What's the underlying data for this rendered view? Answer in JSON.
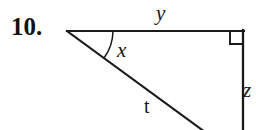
{
  "figure": {
    "problem_number": "10.",
    "labels": {
      "top_side": "y",
      "right_side": "z",
      "hypotenuse": "t",
      "angle": "x"
    },
    "geometry": {
      "apex": {
        "x": 67,
        "y": 31
      },
      "top_right": {
        "x": 243,
        "y": 31
      },
      "bottom_cut": {
        "x": 203,
        "y": 130
      },
      "right_angle_marker_size": 13,
      "angle_arc_radius": 46
    },
    "stroke_color": "#1a1a1a",
    "background_color": "#ffffff"
  }
}
